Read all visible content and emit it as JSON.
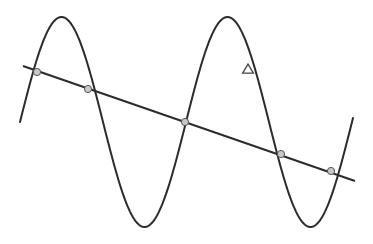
{
  "diagram": {
    "colors": {
      "background": "#ffffff",
      "curve": "#2b2b2b",
      "line": "#2b2b2b",
      "point_fill": "#c8c8c8",
      "point_stroke": "#555555",
      "triangle_stroke": "#444444"
    },
    "curve": {
      "type": "sine",
      "x_start": 20,
      "x_end": 353,
      "center_y": 122,
      "amplitude": 105,
      "wavelength": 166,
      "phase_x": 20,
      "direction": "rising-first"
    },
    "line": {
      "x1": 23,
      "y1": 66,
      "x2": 355,
      "y2": 181
    },
    "intersection_points": [
      {
        "x": 37,
        "y": 72
      },
      {
        "x": 88,
        "y": 89
      },
      {
        "x": 185,
        "y": 122
      },
      {
        "x": 281,
        "y": 154
      },
      {
        "x": 331,
        "y": 171
      }
    ],
    "triangle_marker": {
      "x": 248,
      "y": 69,
      "size": 9
    }
  }
}
